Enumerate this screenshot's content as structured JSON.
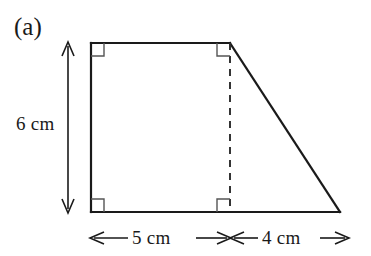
{
  "figure": {
    "part_label": "(a)",
    "shape_name": "right-trapezoid",
    "background_color": "#ffffff",
    "stroke_color": "#1a1a1a",
    "dashed_stroke_color": "#2a2a2a",
    "right_angle_marker_color": "#555555"
  },
  "dimensions": {
    "height": {
      "label": "6 cm",
      "value": 6,
      "unit": "cm",
      "orientation": "vertical",
      "arrow_style": "double-headed"
    },
    "base_left": {
      "label": "5 cm",
      "value": 5,
      "unit": "cm",
      "orientation": "horizontal",
      "arrow_style": "double-headed"
    },
    "base_right": {
      "label": "4 cm",
      "value": 4,
      "unit": "cm",
      "orientation": "horizontal",
      "arrow_style": "double-headed"
    }
  },
  "geometry": {
    "vertices": {
      "top_left": [
        91,
        43
      ],
      "top_right": [
        230,
        43
      ],
      "bottom_right": [
        340,
        212
      ],
      "bottom_left": [
        91,
        212
      ]
    },
    "dashed_line": {
      "x": 230,
      "y_top": 43,
      "y_bottom": 212
    },
    "right_angle_markers": [
      {
        "at": "top-left",
        "x": 91,
        "y": 43
      },
      {
        "at": "top-right-interior",
        "x": 230,
        "y": 43
      },
      {
        "at": "bottom-left",
        "x": 91,
        "y": 212
      },
      {
        "at": "bottom-right-interior",
        "x": 230,
        "y": 212
      }
    ]
  }
}
